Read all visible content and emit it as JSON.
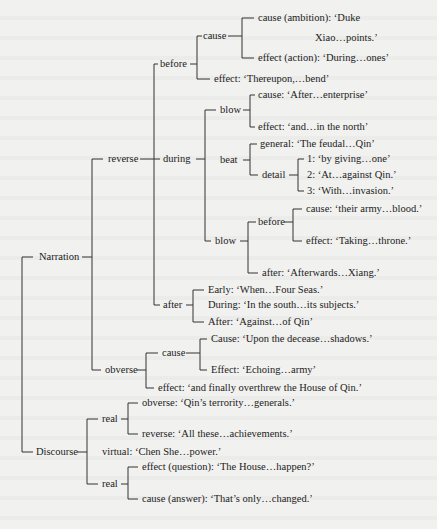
{
  "nodes": {
    "narration": "Narration",
    "reverse": "reverse",
    "before": "before",
    "before_cause": "cause",
    "cause_ambition_1": "cause (ambition): ‘Duke",
    "cause_ambition_2": "Xiao…points.’",
    "effect_action": "effect (action): ‘During…ones’",
    "before_effect": "effect: ‘Thereupon,…bend’",
    "during": "during",
    "blow1": "blow",
    "blow1_cause": "cause: ‘After…enterprise’",
    "blow1_effect": "effect: ‘and…in the north’",
    "beat": "beat",
    "beat_general": "general: ‘The feudal…Qin’",
    "beat_detail": "detail",
    "detail_1": "1: ‘by giving…one’",
    "detail_2": "2: ‘At…against Qin.’",
    "detail_3": "3: ‘With…invasion.’",
    "blow2": "blow",
    "blow2_before": "before",
    "blow2_cause": "cause: ‘their army…blood.’",
    "blow2_effect": "effect: ‘Taking…throne.’",
    "blow2_after": "after: ‘Afterwards…Xiang.’",
    "after": "after",
    "after_early": "Early: ‘When…Four Seas.’",
    "after_during": "During: ‘In the south…its subjects.’",
    "after_after": "After: ‘Against…of Qin’",
    "obverse": "obverse",
    "obverse_cause": "cause",
    "obverse_cause_cause": "Cause: ‘Upon the decease…shadows.’",
    "obverse_cause_effect": "Effect: ‘Echoing…army’",
    "obverse_effect": "effect: ‘and finally overthrew the House of Qin.’",
    "discourse": "Discourse",
    "real1": "real",
    "real1_obverse": "obverse: ‘Qin’s terrority…generals.’",
    "real1_reverse": "reverse: ‘All these…achievements.’",
    "virtual": "virtual: ‘Chen She…power.’",
    "real2": "real",
    "real2_effect": "effect (question): ‘The House…happen?’",
    "real2_cause": "cause (answer): ‘That’s only…changed.’"
  }
}
